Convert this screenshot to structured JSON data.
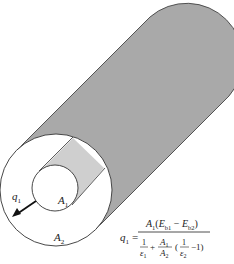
{
  "diagram": {
    "colors": {
      "outer_cylinder_surface": "#a9a9a9",
      "inner_cylinder_surface": "#cfcfcf",
      "outline": "#333333",
      "background": "#ffffff"
    },
    "labels": {
      "q1": {
        "main": "q",
        "sub": "1"
      },
      "A1": {
        "main": "A",
        "sub": "1"
      },
      "A2": {
        "main": "A",
        "sub": "2"
      }
    },
    "equation": {
      "lhs": {
        "main": "q",
        "sub": "1"
      },
      "equals": "=",
      "numerator": "A₁(Eᵇ₁ − Eᵇ₂)",
      "numerator_parts": {
        "A": "A",
        "A_sub": "1",
        "open": "(",
        "Eb1": "E",
        "Eb1_sub": "b1",
        "minus": " − ",
        "Eb2": "E",
        "Eb2_sub": "b2",
        "close": ")"
      },
      "denominator_parts": {
        "one_a": "1",
        "eps1": "ε",
        "eps1_sub": "1",
        "plus": "+",
        "A1": "A",
        "A1_sub": "1",
        "A2": "A",
        "A2_sub": "2",
        "open": "(",
        "one_b": "1",
        "eps2": "ε",
        "eps2_sub": "2",
        "minus_one": "−1)"
      }
    }
  }
}
